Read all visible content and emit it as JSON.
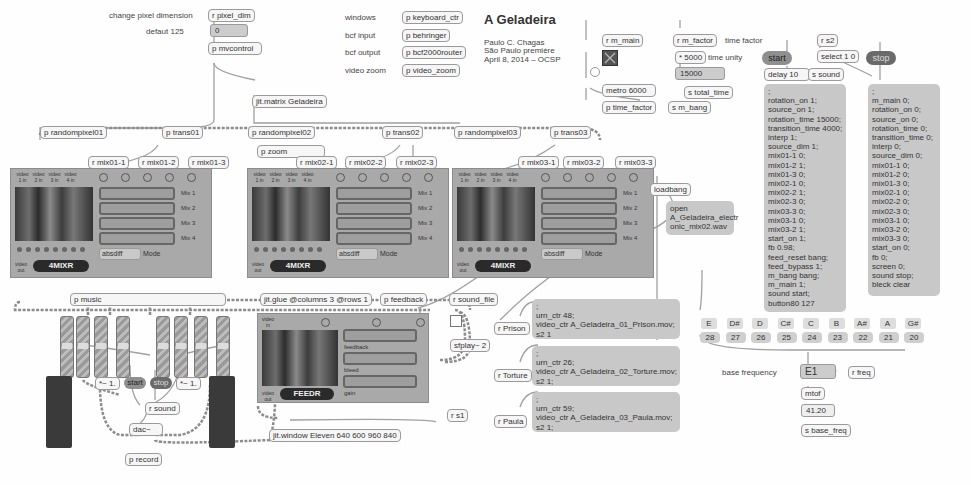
{
  "title": {
    "main": "A Geladeira",
    "author": "Paulo C. Chagas",
    "line2": "São Paulo première",
    "line3": "April 8, 2014 – OCSP"
  },
  "pixel": {
    "label": "change pixel dimension",
    "receiver": "r pixel_dim",
    "default_label": "defaut 125",
    "number": "0",
    "mvcontrol": "p mvcontrol",
    "matrix": "jit.matrix Geladeira"
  },
  "control_rows": [
    {
      "label": "windows",
      "object": "p keyboard_ctr"
    },
    {
      "label": "bcf input",
      "object": "p behringer"
    },
    {
      "label": "bcf output",
      "object": "p bcf2000router"
    },
    {
      "label": "video zoom",
      "object": "p video_zoom"
    }
  ],
  "metro": {
    "receiver": "r m_main",
    "object": "metro 6000",
    "time_factor_obj": "p time_factor",
    "send_bang": "s m_bang"
  },
  "timing": {
    "receiver": "r m_factor",
    "receiver_label": "time factor",
    "multiply": "* 5000",
    "multiply_label": "time unity",
    "number": "15000",
    "send": "s total_time"
  },
  "start_stop": {
    "start_label": "start",
    "stop_label": "stop",
    "receiver": "r s2",
    "select": "select 1 0",
    "delay": "delay 10",
    "send_sound": "s sound"
  },
  "start_message": [
    ";",
    "rotation_on 1;",
    "source_on 1;",
    "rotation_time 15000;",
    "transition_time 4000;",
    "interp 1;",
    "source_dim 1;",
    "mix01-1 0;",
    "mix01-2 1;",
    "mix01-3 0;",
    "mix02-1 0;",
    "mix02-2 1;",
    "mix02-3 0;",
    "mix03-3 0;",
    "mix03-1 0;",
    "mix03-2 1;",
    "start_on 1;",
    "fb 0.98;",
    "feed_reset bang;",
    "feed_bypass 1;",
    "m_bang bang;",
    "m_main 1;",
    "sound start;",
    "button80 127"
  ],
  "stop_message": [
    ";",
    "m_main 0;",
    "rotation_on 0;",
    "source_on 0;",
    "rotation_time 0;",
    "transition_time 0;",
    "interp 0;",
    "source_dim 0;",
    "mix01-1 0;",
    "mix01-2 0;",
    "mix01-3 0;",
    "mix02-1 0;",
    "mix02-2 0;",
    "mix02-3 0;",
    "mix03-1 0;",
    "mix03-2 0;",
    "mix03-3 0;",
    "start_on 0;",
    "fb 0;",
    "screen 0;",
    "sound stop;",
    "bleck clear"
  ],
  "row_objects": [
    "p randompixel01",
    "p trans01",
    "p randompixel02",
    "p trans02",
    "p randompixel03",
    "p trans03"
  ],
  "zoom_obj": "p zoom",
  "mix_receivers": [
    [
      "r mix01-1",
      "r mix01-2",
      "r mix01-3"
    ],
    [
      "r mix02-1",
      "r mix02-2",
      "r mix02-3"
    ],
    [
      "r mix03-1",
      "r mix03-2",
      "r mix03-3"
    ]
  ],
  "mixer": {
    "title": "4MIXR",
    "inputs": [
      "video 1 in",
      "video 2 in",
      "video 3 in",
      "video 4 in"
    ],
    "bars": [
      "Mix 1",
      "Mix 2",
      "Mix 3",
      "Mix 4"
    ],
    "mode_value": "absdiff",
    "mode_label": "Mode",
    "out_label": "video out"
  },
  "loadbang": {
    "object": "loadbang",
    "message": "open\nA_Geladeira_electr\nonic_mix02.wav"
  },
  "music": {
    "object": "p music",
    "mult_left": "*~ 1.",
    "mult_right": "*~ 1.",
    "start": "start",
    "stop": "stop",
    "receiver": "r sound",
    "dac": "dac~",
    "record": "p record"
  },
  "glue": "jit.glue @columns 3 @rows 1",
  "feedback_obj": "p feedback",
  "feedr": {
    "title": "FEEDR",
    "input": "video in",
    "out": "video out",
    "bars": [
      "feedback",
      "bleed",
      "gain"
    ]
  },
  "sound_file": {
    "receiver": "r sound_file",
    "sfplay": "sfplay~ 2"
  },
  "window_obj": "jit.window Eleven 640 600 960 840",
  "rs1": "r s1",
  "videos": [
    {
      "receiver": "r Prison",
      "message": ";\nurn_ctr 48;\nvideo_ctr A_Geladeira_01_Prison.mov;\ns2 1"
    },
    {
      "receiver": "r Torture",
      "message": ";\nurn_ctr 26;\nvideo_ctr A_Geladeira_02_Torture.mov;\ns2 1;"
    },
    {
      "receiver": "r Paula",
      "message": ";\nurn_ctr 59;\nvideo_ctr A_Geladeira_03_Paula.mov;\ns2 1;"
    }
  ],
  "notes": {
    "names": [
      "E",
      "D#",
      "D",
      "C#",
      "C",
      "B",
      "A#",
      "A",
      "G#"
    ],
    "numbers": [
      "28",
      "27",
      "26",
      "25",
      "24",
      "23",
      "22",
      "21",
      "20"
    ],
    "base_label": "base frequency",
    "base_value": "E1",
    "receiver": "r freq",
    "mtof": "mtof",
    "freq_value": "41.20",
    "send": "s base_freq"
  },
  "colors": {
    "background": "#fefefe",
    "message_box": "#c8c8c8",
    "panel": "#a9a9a9",
    "start_button": "#8f8f8f",
    "stop_button": "#6a6a6a",
    "meter": "#3a3a3a"
  }
}
